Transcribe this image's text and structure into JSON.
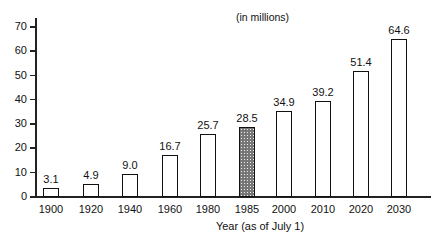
{
  "chart_data": {
    "type": "bar",
    "title": "(in millions)",
    "xlabel": "Year (as of July 1)",
    "ylabel": "",
    "ylim": [
      0,
      70
    ],
    "yticks": [
      0,
      10,
      20,
      30,
      40,
      50,
      60,
      70
    ],
    "grid": false,
    "categories": [
      "1900",
      "1920",
      "1940",
      "1960",
      "1980",
      "1985",
      "2000",
      "2010",
      "2020",
      "2030"
    ],
    "values": [
      3.1,
      4.9,
      9.0,
      16.7,
      25.7,
      28.5,
      34.9,
      39.2,
      51.4,
      64.6
    ],
    "value_labels": [
      "3.1",
      "4.9",
      "9.0",
      "16.7",
      "25.7",
      "28.5",
      "34.9",
      "39.2",
      "51.4",
      "64.6"
    ],
    "highlighted_category": "1985"
  }
}
